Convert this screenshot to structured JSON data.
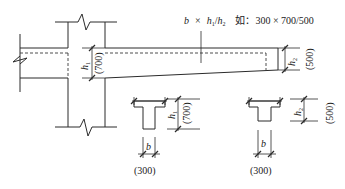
{
  "annotation": {
    "formula_b": "b",
    "formula_times": "×",
    "formula_h1": "h",
    "formula_h1_sub": "1",
    "formula_slash": "/",
    "formula_h2": "h",
    "formula_h2_sub": "2",
    "example_label": "如：",
    "example_value": "300 × 700/500"
  },
  "elevation": {
    "h1_label": "h",
    "h1_sub": "1",
    "h1_value": "(700)",
    "h2_label": "h",
    "h2_sub": "2",
    "h2_value": "(500)"
  },
  "section_left": {
    "b_label": "b",
    "b_value": "(300)",
    "h_label": "h",
    "h_sub": "1",
    "h_value": "(700)"
  },
  "section_right": {
    "b_label": "b",
    "b_value": "(300)",
    "h_label": "h",
    "h_sub": "2",
    "h_value": "(500)"
  },
  "colors": {
    "line": "#2b2b2b",
    "background": "#ffffff"
  }
}
